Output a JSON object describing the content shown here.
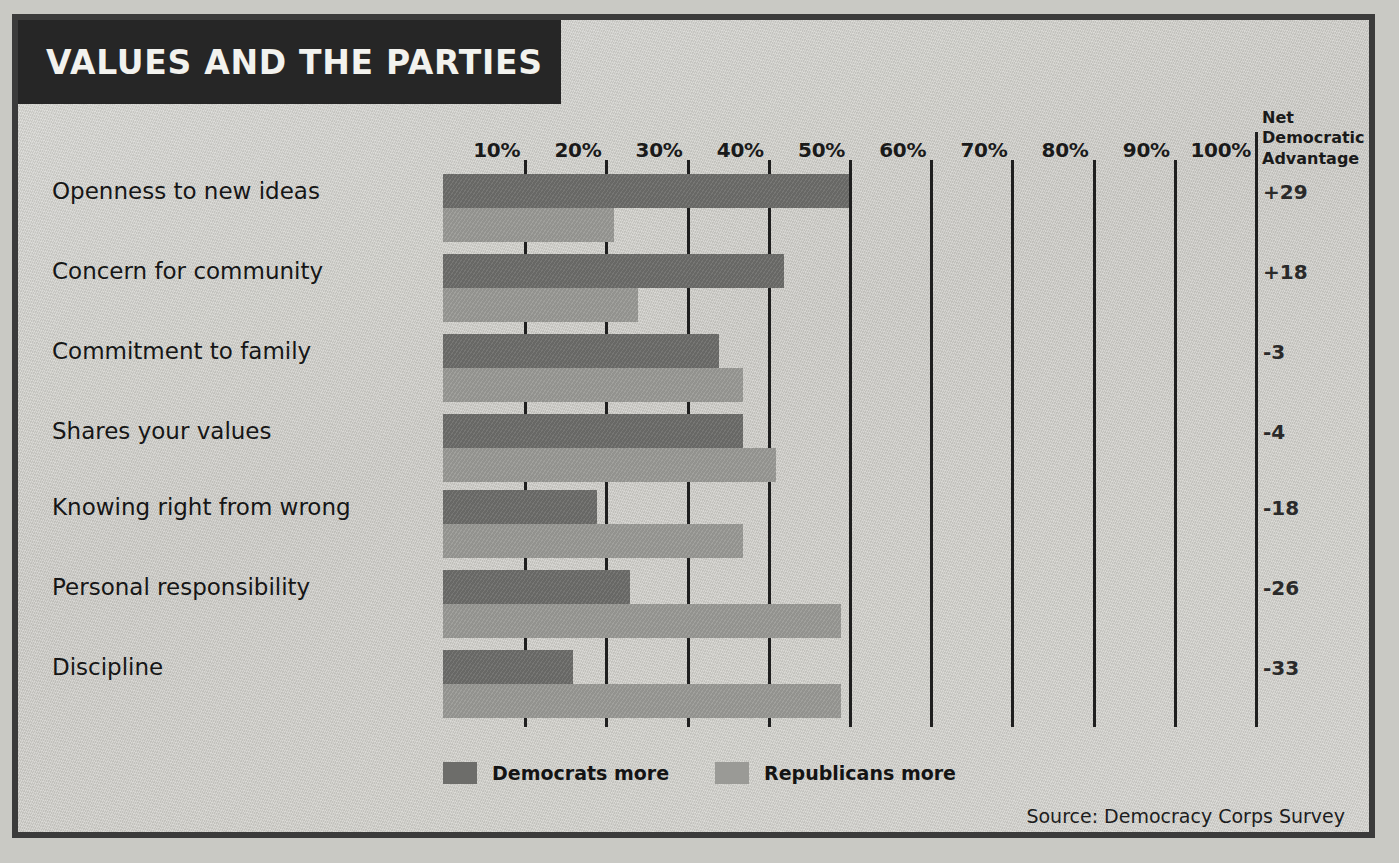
{
  "title": "VALUES AND THE PARTIES",
  "net_header_lines": [
    "Net",
    "Democratic",
    "Advantage"
  ],
  "source": "Source: Democracy Corps Survey",
  "legend": [
    {
      "label": "Democrats more",
      "color": "#6d6d6a",
      "key": "democrats"
    },
    {
      "label": "Republicans more",
      "color": "#9a9a96",
      "key": "republicans"
    }
  ],
  "chart_data": {
    "type": "bar",
    "orientation": "horizontal",
    "title": "VALUES AND THE PARTIES",
    "subtitle": "",
    "xlabel": "",
    "ylabel": "",
    "xlim": [
      0,
      100
    ],
    "xtick_labels": [
      "10%",
      "20%",
      "30%",
      "40%",
      "50%",
      "60%",
      "70%",
      "80%",
      "90%",
      "100%"
    ],
    "xticks": [
      10,
      20,
      30,
      40,
      50,
      60,
      70,
      80,
      90,
      100
    ],
    "grid": true,
    "legend_position": "bottom-left",
    "categories": [
      "Openness to new ideas",
      "Concern for community",
      "Commitment to family",
      "Shares your values",
      "Knowing right from wrong",
      "Personal responsibility",
      "Discipline"
    ],
    "series": [
      {
        "name": "Democrats more",
        "color": "#6d6d6a",
        "values": [
          50,
          42,
          34,
          37,
          19,
          23,
          16
        ]
      },
      {
        "name": "Republicans more",
        "color": "#9a9a96",
        "values": [
          21,
          24,
          37,
          41,
          37,
          49,
          49
        ]
      }
    ],
    "annotation_column": {
      "header": "Net Democratic Advantage",
      "values": [
        "+29",
        "+18",
        "-3",
        "-4",
        "-18",
        "-26",
        "-33"
      ]
    },
    "source": "Source: Democracy Corps Survey"
  }
}
